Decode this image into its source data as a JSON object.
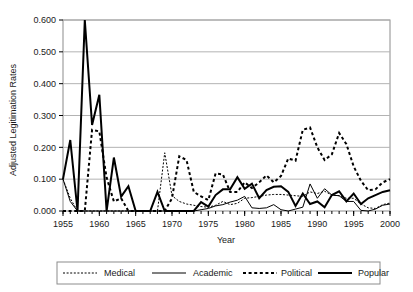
{
  "chart_data": {
    "type": "line",
    "title": "",
    "xlabel": "Year",
    "ylabel": "Adjusted Legitimation Rates",
    "xlim": [
      1955,
      2000
    ],
    "ylim": [
      0.0,
      0.6
    ],
    "ytick_labels": [
      "0.000",
      "0.100",
      "0.200",
      "0.300",
      "0.400",
      "0.500",
      "0.600"
    ],
    "ytick_values": [
      0.0,
      0.1,
      0.2,
      0.3,
      0.4,
      0.5,
      0.6
    ],
    "xtick_labels": [
      "1955",
      "1960",
      "1965",
      "1970",
      "1975",
      "1980",
      "1985",
      "1990",
      "1995",
      "2000"
    ],
    "xtick_values": [
      1955,
      1960,
      1965,
      1970,
      1975,
      1980,
      1985,
      1990,
      1995,
      2000
    ],
    "xtick_minor_step": 1,
    "grid": "horizontal",
    "legend_position": "bottom",
    "x": [
      1955,
      1956,
      1957,
      1958,
      1959,
      1960,
      1961,
      1962,
      1963,
      1964,
      1965,
      1966,
      1967,
      1968,
      1969,
      1970,
      1971,
      1972,
      1973,
      1974,
      1975,
      1976,
      1977,
      1978,
      1979,
      1980,
      1981,
      1982,
      1983,
      1984,
      1985,
      1986,
      1987,
      1988,
      1989,
      1990,
      1991,
      1992,
      1993,
      1994,
      1995,
      1996,
      1997,
      1998,
      1999,
      2000
    ],
    "series": [
      {
        "name": "Medical",
        "style": "fine-dotted",
        "color": "#000000",
        "width": 1,
        "values": [
          0.1,
          0.04,
          0.0,
          0.0,
          0.0,
          0.0,
          0.0,
          0.0,
          0.0,
          0.0,
          0.0,
          0.0,
          0.0,
          0.0,
          0.183,
          0.048,
          0.03,
          0.022,
          0.018,
          0.014,
          0.012,
          0.018,
          0.03,
          0.02,
          0.024,
          0.04,
          0.042,
          0.046,
          0.05,
          0.052,
          0.052,
          0.05,
          0.048,
          0.046,
          0.06,
          0.055,
          0.062,
          0.05,
          0.048,
          0.04,
          0.04,
          0.022,
          0.01,
          0.008,
          0.02,
          0.025
        ]
      },
      {
        "name": "Academic",
        "style": "thin-solid",
        "color": "#000000",
        "width": 1,
        "values": [
          0.1,
          0.03,
          0.0,
          0.0,
          0.0,
          0.0,
          0.0,
          0.0,
          0.0,
          0.0,
          0.0,
          0.0,
          0.0,
          0.0,
          0.0,
          0.0,
          0.0,
          0.0,
          0.0,
          0.004,
          0.008,
          0.016,
          0.02,
          0.028,
          0.034,
          0.046,
          0.01,
          0.008,
          0.01,
          0.02,
          0.004,
          0.0,
          0.006,
          0.012,
          0.085,
          0.04,
          0.07,
          0.05,
          0.048,
          0.03,
          0.03,
          0.002,
          0.0,
          0.006,
          0.018,
          0.022
        ]
      },
      {
        "name": "Political",
        "style": "thick-dashed",
        "color": "#000000",
        "width": 2,
        "values": [
          0.0,
          0.0,
          0.0,
          0.0,
          0.255,
          0.25,
          0.105,
          0.03,
          0.04,
          0.0,
          0.0,
          0.0,
          0.0,
          0.0,
          0.0,
          0.04,
          0.172,
          0.16,
          0.06,
          0.046,
          0.034,
          0.118,
          0.115,
          0.06,
          0.06,
          0.09,
          0.072,
          0.09,
          0.112,
          0.09,
          0.11,
          0.165,
          0.158,
          0.255,
          0.262,
          0.2,
          0.16,
          0.178,
          0.245,
          0.21,
          0.14,
          0.095,
          0.065,
          0.068,
          0.09,
          0.1
        ]
      },
      {
        "name": "Popular",
        "style": "thick-solid",
        "color": "#000000",
        "width": 2,
        "values": [
          0.1,
          0.223,
          0.0,
          0.6,
          0.27,
          0.365,
          0.0,
          0.168,
          0.045,
          0.078,
          0.0,
          0.0,
          0.0,
          0.06,
          0.0,
          0.0,
          0.0,
          0.0,
          0.0,
          0.028,
          0.014,
          0.05,
          0.068,
          0.068,
          0.106,
          0.07,
          0.086,
          0.04,
          0.066,
          0.076,
          0.078,
          0.06,
          0.016,
          0.055,
          0.022,
          0.03,
          0.012,
          0.05,
          0.062,
          0.03,
          0.055,
          0.022,
          0.04,
          0.05,
          0.06,
          0.065
        ]
      }
    ]
  },
  "legend": {
    "items": [
      {
        "label": "Medical",
        "style": "fine-dotted"
      },
      {
        "label": "Academic",
        "style": "thin-solid"
      },
      {
        "label": "Political",
        "style": "thick-dashed"
      },
      {
        "label": "Popular",
        "style": "thick-solid"
      }
    ]
  },
  "colors": {
    "ink": "#000000",
    "grid": "#b3b3b3",
    "frame": "#8c8c8c",
    "background": "#ffffff"
  }
}
